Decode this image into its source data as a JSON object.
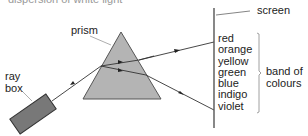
{
  "diagram": {
    "title_fragment": "dispersion of white light",
    "labels": {
      "prism": "prism",
      "ray_box_line1": "ray",
      "ray_box_line2": "box",
      "screen": "screen",
      "band_line1": "band of",
      "band_line2": "colours"
    },
    "spectrum": [
      "red",
      "orange",
      "yellow",
      "green",
      "blue",
      "indigo",
      "violet"
    ],
    "colors": {
      "prism_fill": "#b4b4b4",
      "ray_box_fill": "#787878",
      "line": "#333333",
      "leader": "#999999"
    }
  }
}
